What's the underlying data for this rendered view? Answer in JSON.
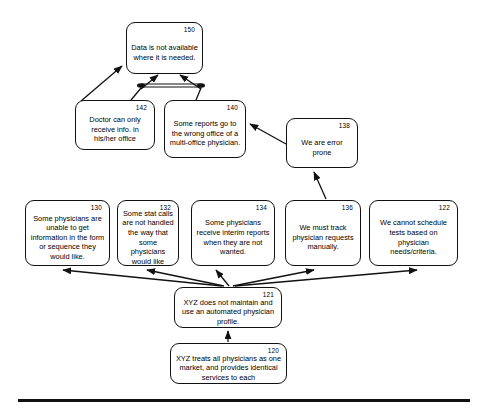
{
  "diagram": {
    "type": "flowchart",
    "title": "",
    "nodes": [
      {
        "id": "n150",
        "ref": "150",
        "text": "Data is not available where it is needed.",
        "x": 126,
        "y": 22,
        "w": 77,
        "h": 52
      },
      {
        "id": "n142",
        "ref": "142",
        "text": "Doctor can only receive info. in his/her office",
        "x": 75,
        "y": 100,
        "w": 80,
        "h": 50
      },
      {
        "id": "n140",
        "ref": "140",
        "text": "Some reports go to the wrong office of a multi-office physician.",
        "x": 164,
        "y": 100,
        "w": 82,
        "h": 58
      },
      {
        "id": "n138",
        "ref": "138",
        "text": "We are error prone",
        "x": 286,
        "y": 118,
        "w": 72,
        "h": 50
      },
      {
        "id": "n130",
        "ref": "130",
        "text": "Some physicians are unable to get information in the form or sequence they would like.",
        "x": 25,
        "y": 200,
        "w": 85,
        "h": 66
      },
      {
        "id": "n132",
        "ref": "132",
        "text": "Some stat calls are not handled the way that some physicians would like",
        "x": 117,
        "y": 200,
        "w": 62,
        "h": 66
      },
      {
        "id": "n134",
        "ref": "134",
        "text": "Some physicians receive interim reports when they are not wanted.",
        "x": 191,
        "y": 200,
        "w": 84,
        "h": 66
      },
      {
        "id": "n136",
        "ref": "136",
        "text": "We must track physician requests manually.",
        "x": 285,
        "y": 200,
        "w": 76,
        "h": 66
      },
      {
        "id": "n122",
        "ref": "122",
        "text": "We cannot schedule tests based on physician needs/criteria.",
        "x": 369,
        "y": 200,
        "w": 89,
        "h": 66
      },
      {
        "id": "n121",
        "ref": "121",
        "text": "XYZ does not maintain and use an automated physician profile.",
        "x": 174,
        "y": 287,
        "w": 108,
        "h": 41
      },
      {
        "id": "n120",
        "ref": "120",
        "text": "XYZ treats all physicians as one market, and provides identical services to each",
        "x": 170,
        "y": 343,
        "w": 117,
        "h": 41
      }
    ],
    "edges": [
      {
        "from": "n142",
        "to": "n150",
        "kind": "arrow"
      },
      {
        "from": "n142",
        "to": "n150",
        "kind": "arrow-and-junction"
      },
      {
        "from": "n140",
        "to": "n150",
        "kind": "arrow-and-junction"
      },
      {
        "from": "n138",
        "to": "n140",
        "kind": "arrow"
      },
      {
        "from": "n136",
        "to": "n138",
        "kind": "arrow"
      },
      {
        "from": "n121",
        "to": "n130",
        "kind": "arrow"
      },
      {
        "from": "n121",
        "to": "n132",
        "kind": "arrow"
      },
      {
        "from": "n121",
        "to": "n134",
        "kind": "arrow"
      },
      {
        "from": "n121",
        "to": "n136",
        "kind": "arrow"
      },
      {
        "from": "n121",
        "to": "n122",
        "kind": "arrow"
      },
      {
        "from": "n120",
        "to": "n121",
        "kind": "arrow"
      }
    ],
    "colors": {
      "stroke": "#111111",
      "fill": "#ffffff",
      "text": "#000000"
    }
  }
}
